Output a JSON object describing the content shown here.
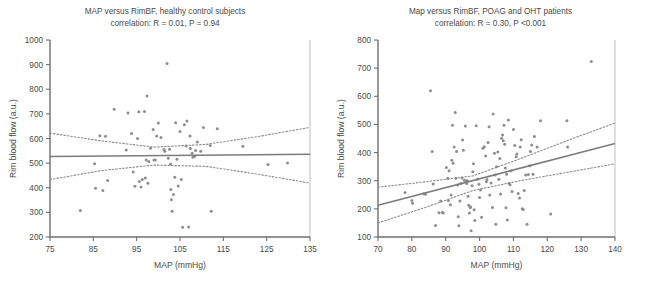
{
  "figure": {
    "width": 651,
    "height": 282,
    "background": "#ffffff",
    "point_color": "#8e8e8e",
    "line_color": "#7c7c7c",
    "axis_color": "#6f6f6f"
  },
  "chart_data": [
    {
      "type": "scatter",
      "panel": "left",
      "title": "MAP versus RimBF, healthy control subjects",
      "subtitle": "correlation: R = 0.01, P = 0.94",
      "stats": {
        "R": "0.01",
        "P": "0.94",
        "R_label": "R = 0.01",
        "P_label": "P = 0.94"
      },
      "xlabel": "MAP (mmHg)",
      "ylabel": "Rim blood flow (a.u.)",
      "xlim": [
        75,
        135
      ],
      "ylim": [
        200,
        1000
      ],
      "xticks": [
        75,
        85,
        95,
        105,
        115,
        125,
        135
      ],
      "xticklabels": [
        "75",
        "85",
        "95",
        "105",
        "115",
        "125",
        "135"
      ],
      "yticks": [
        200,
        300,
        400,
        500,
        600,
        700,
        800,
        900,
        1000
      ],
      "yticklabels": [
        "200",
        "300",
        "400",
        "500",
        "600",
        "700",
        "800",
        "900",
        "1000"
      ],
      "grid": false,
      "legend": "none",
      "fit_line": {
        "x": [
          75,
          135
        ],
        "y": [
          527,
          536
        ]
      },
      "ci_upper": {
        "x": [
          75,
          87,
          99,
          111,
          123,
          135
        ],
        "y": [
          622,
          590,
          565,
          576,
          608,
          645
        ]
      },
      "ci_lower": {
        "x": [
          75,
          87,
          99,
          111,
          123,
          135
        ],
        "y": [
          433,
          470,
          492,
          487,
          455,
          419
        ]
      },
      "points": [
        [
          82.0,
          308
        ],
        [
          85.3,
          497
        ],
        [
          85.5,
          398
        ],
        [
          86.5,
          611
        ],
        [
          87.2,
          389
        ],
        [
          87.8,
          609
        ],
        [
          88.3,
          429
        ],
        [
          89.8,
          719
        ],
        [
          92.6,
          553
        ],
        [
          93.0,
          704
        ],
        [
          93.8,
          620
        ],
        [
          94.2,
          464
        ],
        [
          94.6,
          406
        ],
        [
          95.2,
          600
        ],
        [
          95.5,
          709
        ],
        [
          95.6,
          425
        ],
        [
          96.0,
          403
        ],
        [
          96.3,
          433
        ],
        [
          96.8,
          710
        ],
        [
          97.0,
          440
        ],
        [
          97.2,
          513
        ],
        [
          97.4,
          773
        ],
        [
          97.6,
          418
        ],
        [
          97.8,
          507
        ],
        [
          98.2,
          560
        ],
        [
          98.8,
          637
        ],
        [
          99.0,
          513
        ],
        [
          99.3,
          513
        ],
        [
          99.6,
          610
        ],
        [
          100.0,
          663
        ],
        [
          100.6,
          604
        ],
        [
          101.3,
          555
        ],
        [
          101.5,
          548
        ],
        [
          102.0,
          905
        ],
        [
          102.3,
          520
        ],
        [
          102.6,
          556
        ],
        [
          102.8,
          496
        ],
        [
          102.9,
          393
        ],
        [
          103.0,
          351
        ],
        [
          103.2,
          305
        ],
        [
          103.5,
          373
        ],
        [
          103.8,
          443
        ],
        [
          104.0,
          664
        ],
        [
          104.3,
          516
        ],
        [
          104.6,
          407
        ],
        [
          105.0,
          628
        ],
        [
          105.3,
          433
        ],
        [
          105.6,
          240
        ],
        [
          106.0,
          656
        ],
        [
          106.4,
          570
        ],
        [
          106.6,
          671
        ],
        [
          107.0,
          241
        ],
        [
          107.3,
          610
        ],
        [
          107.4,
          559
        ],
        [
          107.8,
          540
        ],
        [
          108.0,
          524
        ],
        [
          108.4,
          528
        ],
        [
          108.6,
          551
        ],
        [
          109.0,
          586
        ],
        [
          109.8,
          548
        ],
        [
          110.4,
          645
        ],
        [
          112.0,
          572
        ],
        [
          112.2,
          305
        ],
        [
          113.6,
          640
        ],
        [
          119.5,
          569
        ],
        [
          125.3,
          494
        ],
        [
          129.8,
          501
        ]
      ]
    },
    {
      "type": "scatter",
      "panel": "right",
      "title": "Map versus RimBF, POAG and OHT patients",
      "subtitle": "correlation: R = 0.30, P <0.001",
      "stats": {
        "R": "0.30",
        "P": "<0.001",
        "R_label": "R = 0.30",
        "P_label": "P <0.001"
      },
      "xlabel": "MAP (mmHg)",
      "ylabel": "Rim blood flow (a.u.)",
      "xlim": [
        70,
        140
      ],
      "ylim": [
        100,
        800
      ],
      "xticks": [
        70,
        80,
        90,
        100,
        110,
        120,
        130,
        140
      ],
      "xticklabels": [
        "70",
        "80",
        "90",
        "100",
        "110",
        "120",
        "130",
        "140"
      ],
      "yticks": [
        100,
        200,
        300,
        400,
        500,
        600,
        700,
        800
      ],
      "yticklabels": [
        "100",
        "200",
        "300",
        "400",
        "500",
        "600",
        "700",
        "800"
      ],
      "grid": false,
      "legend": "none",
      "fit_line": {
        "x": [
          70,
          140
        ],
        "y": [
          213,
          432
        ]
      },
      "ci_upper": {
        "x": [
          70,
          84,
          98,
          112,
          126,
          140
        ],
        "y": [
          277,
          296,
          317,
          378,
          443,
          505
        ]
      },
      "ci_lower": {
        "x": [
          70,
          84,
          98,
          112,
          126,
          140
        ],
        "y": [
          150,
          205,
          265,
          300,
          330,
          360
        ]
      },
      "points": [
        [
          78.0,
          258
        ],
        [
          80.0,
          230
        ],
        [
          80.2,
          220
        ],
        [
          83.5,
          254
        ],
        [
          84.0,
          252
        ],
        [
          85.5,
          620
        ],
        [
          86.0,
          404
        ],
        [
          86.3,
          288
        ],
        [
          87.0,
          141
        ],
        [
          88.0,
          186
        ],
        [
          88.5,
          228
        ],
        [
          89.0,
          188
        ],
        [
          89.3,
          185
        ],
        [
          90.2,
          347
        ],
        [
          90.6,
          309
        ],
        [
          90.8,
          230
        ],
        [
          91.0,
          335
        ],
        [
          91.4,
          215
        ],
        [
          91.6,
          249
        ],
        [
          91.8,
          373
        ],
        [
          92.0,
          497
        ],
        [
          92.2,
          362
        ],
        [
          92.5,
          420
        ],
        [
          92.8,
          542
        ],
        [
          93.0,
          309
        ],
        [
          93.2,
          404
        ],
        [
          93.5,
          285
        ],
        [
          93.7,
          172
        ],
        [
          93.9,
          140
        ],
        [
          94.2,
          228
        ],
        [
          94.5,
          290
        ],
        [
          94.8,
          310
        ],
        [
          95.0,
          445
        ],
        [
          95.2,
          408
        ],
        [
          95.5,
          302
        ],
        [
          95.8,
          494
        ],
        [
          96.0,
          300
        ],
        [
          96.2,
          290
        ],
        [
          96.4,
          300
        ],
        [
          96.6,
          245
        ],
        [
          96.8,
          213
        ],
        [
          97.0,
          185
        ],
        [
          97.2,
          205
        ],
        [
          97.4,
          207
        ],
        [
          97.5,
          122
        ],
        [
          97.8,
          282
        ],
        [
          98.0,
          332
        ],
        [
          98.2,
          360
        ],
        [
          98.4,
          197
        ],
        [
          98.6,
          159
        ],
        [
          99.0,
          495
        ],
        [
          99.4,
          305
        ],
        [
          99.8,
          287
        ],
        [
          100.0,
          240
        ],
        [
          100.3,
          267
        ],
        [
          100.6,
          170
        ],
        [
          101.0,
          415
        ],
        [
          101.4,
          421
        ],
        [
          101.8,
          388
        ],
        [
          102.0,
          296
        ],
        [
          102.2,
          304
        ],
        [
          102.5,
          436
        ],
        [
          102.8,
          492
        ],
        [
          103.0,
          249
        ],
        [
          103.4,
          292
        ],
        [
          103.8,
          205
        ],
        [
          104.0,
          537
        ],
        [
          104.4,
          398
        ],
        [
          104.6,
          320
        ],
        [
          104.8,
          145
        ],
        [
          105.0,
          350
        ],
        [
          105.4,
          402
        ],
        [
          105.7,
          305
        ],
        [
          106.0,
          379
        ],
        [
          106.2,
          253
        ],
        [
          106.5,
          451
        ],
        [
          106.8,
          462
        ],
        [
          107.0,
          442
        ],
        [
          107.2,
          497
        ],
        [
          107.4,
          430
        ],
        [
          107.6,
          345
        ],
        [
          107.8,
          204
        ],
        [
          108.0,
          323
        ],
        [
          108.2,
          160
        ],
        [
          108.5,
          516
        ],
        [
          108.7,
          291
        ],
        [
          109.0,
          286
        ],
        [
          109.3,
          335
        ],
        [
          109.6,
          262
        ],
        [
          110.0,
          482
        ],
        [
          110.4,
          425
        ],
        [
          110.8,
          385
        ],
        [
          111.0,
          395
        ],
        [
          111.4,
          255
        ],
        [
          111.8,
          239
        ],
        [
          112.0,
          420
        ],
        [
          112.3,
          446
        ],
        [
          112.6,
          200
        ],
        [
          112.9,
          198
        ],
        [
          113.2,
          265
        ],
        [
          113.6,
          320
        ],
        [
          114.0,
          145
        ],
        [
          114.4,
          322
        ],
        [
          114.8,
          353
        ],
        [
          115.0,
          404
        ],
        [
          115.4,
          427
        ],
        [
          115.8,
          323
        ],
        [
          116.2,
          457
        ],
        [
          117.0,
          420
        ],
        [
          118.0,
          513
        ],
        [
          121.0,
          182
        ],
        [
          125.8,
          513
        ],
        [
          126.0,
          420
        ],
        [
          133.0,
          724
        ]
      ]
    }
  ]
}
